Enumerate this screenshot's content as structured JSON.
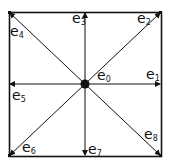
{
  "diagram": {
    "type": "D2Q9 lattice velocity set",
    "vectors": [
      {
        "id": "e0",
        "base": "e",
        "sub": "0",
        "x": 97,
        "y": 68
      },
      {
        "id": "e1",
        "base": "e",
        "sub": "1",
        "x": 146,
        "y": 67
      },
      {
        "id": "e2",
        "base": "e",
        "sub": "2",
        "x": 137,
        "y": 11
      },
      {
        "id": "e3",
        "base": "e",
        "sub": "3",
        "x": 72,
        "y": 11
      },
      {
        "id": "e4",
        "base": "e",
        "sub": "4",
        "x": 10,
        "y": 24
      },
      {
        "id": "e5",
        "base": "e",
        "sub": "5",
        "x": 12,
        "y": 88
      },
      {
        "id": "e6",
        "base": "e",
        "sub": "6",
        "x": 22,
        "y": 140
      },
      {
        "id": "e7",
        "base": "e",
        "sub": "7",
        "x": 88,
        "y": 142
      },
      {
        "id": "e8",
        "base": "e",
        "sub": "8",
        "x": 144,
        "y": 127
      }
    ]
  }
}
